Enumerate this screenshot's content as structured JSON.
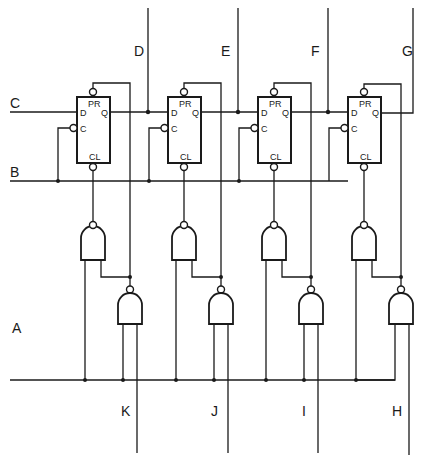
{
  "diagram": {
    "type": "logic circuit schematic - 4-stage shift register with gating",
    "signal_labels": {
      "A": "A",
      "B": "B",
      "C": "C",
      "D": "D",
      "E": "E",
      "F": "F",
      "G": "G",
      "H": "H",
      "I": "I",
      "J": "J",
      "K": "K"
    },
    "flip_flops": [
      {
        "id": "ff1",
        "pins": {
          "pr": "PR",
          "d": "D",
          "q": "Q",
          "c": "C",
          "cl": "CL"
        }
      },
      {
        "id": "ff2",
        "pins": {
          "pr": "PR",
          "d": "D",
          "q": "Q",
          "c": "C",
          "cl": "CL"
        }
      },
      {
        "id": "ff3",
        "pins": {
          "pr": "PR",
          "d": "D",
          "q": "Q",
          "c": "C",
          "cl": "CL"
        }
      },
      {
        "id": "ff4",
        "pins": {
          "pr": "PR",
          "d": "D",
          "q": "Q",
          "c": "C",
          "cl": "CL"
        }
      }
    ],
    "gates": {
      "upper_count": 4,
      "lower_count": 4,
      "type": "NAND"
    },
    "outputs_bottom": [
      "K",
      "J",
      "I",
      "H"
    ],
    "inputs_top": [
      "D",
      "E",
      "F",
      "G"
    ],
    "left_inputs": [
      "C",
      "B",
      "A"
    ]
  }
}
